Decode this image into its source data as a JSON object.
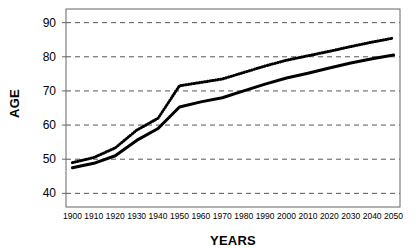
{
  "chart_data": {
    "type": "line",
    "title": "",
    "xlabel": "YEARS",
    "ylabel": "AGE",
    "x": [
      1900,
      1910,
      1920,
      1930,
      1940,
      1950,
      1960,
      1970,
      1980,
      1990,
      2000,
      2010,
      2020,
      2030,
      2040,
      2050
    ],
    "xtick_labels": [
      "1900",
      "1910",
      "1920",
      "1930",
      "1940",
      "1950",
      "1960",
      "1970",
      "1980",
      "1990",
      "2000",
      "2010",
      "2020",
      "2030",
      "2040",
      "2050"
    ],
    "ytick_labels": [
      "90",
      "80",
      "70",
      "60",
      "50",
      "40"
    ],
    "yticks": [
      90,
      80,
      70,
      60,
      50,
      40
    ],
    "ylim": [
      36,
      94
    ],
    "xlim": [
      1897,
      2053
    ],
    "grid": true,
    "grid_style": "dashed",
    "grid_color": "#555555",
    "legend": "none",
    "axis_color": "#666666",
    "series": [
      {
        "name": "solid-line",
        "style": "solid",
        "color": "#000000",
        "width": 3,
        "values": [
          47.5,
          48.8,
          51.0,
          55.5,
          59.0,
          65.3,
          66.8,
          68.0,
          70.0,
          72.0,
          73.8,
          75.2,
          76.7,
          78.2,
          79.4,
          80.5
        ]
      },
      {
        "name": "dotted-line",
        "style": "dotted",
        "color": "#000000",
        "width": 3,
        "values": [
          49.0,
          50.5,
          53.3,
          58.5,
          62.0,
          71.5,
          72.5,
          73.5,
          75.4,
          77.3,
          79.0,
          80.3,
          81.6,
          83.0,
          84.3,
          85.5
        ]
      }
    ]
  }
}
